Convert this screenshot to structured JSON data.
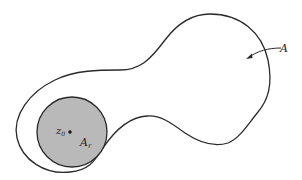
{
  "figure": {
    "labels": {
      "region": "A",
      "subregion_base": "A",
      "subregion_sub": "r",
      "point_base": "z",
      "point_sub": "0"
    },
    "colors": {
      "outline": "#2a2a2a",
      "disk_fill": "#b9b9b9",
      "background": "#ffffff"
    },
    "shapes": {
      "region_outline": "closed smooth peanut/dumbbell-shaped curve A",
      "disk": {
        "center": [
          72,
          132
        ],
        "radius": 35,
        "label": "A_r",
        "shaded": true
      },
      "point": {
        "position": [
          70,
          132
        ],
        "label": "z0"
      },
      "arrow": {
        "from": [
          282,
          48
        ],
        "to": [
          247,
          58
        ],
        "points_to": "region A"
      }
    }
  }
}
